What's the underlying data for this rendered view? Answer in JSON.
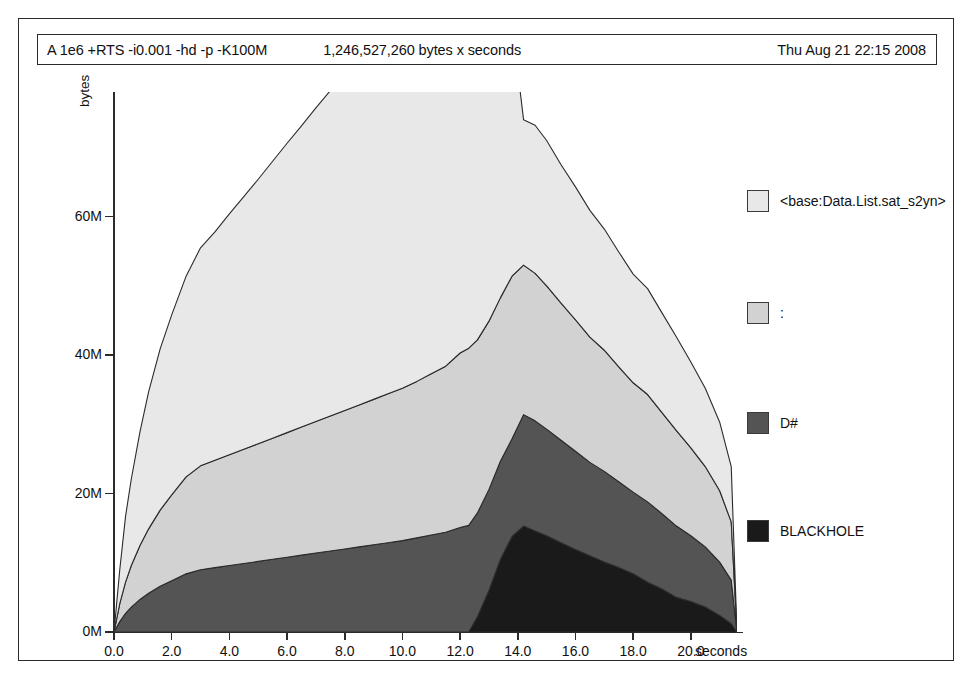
{
  "window": {
    "title_bar": {
      "command": "A 1e6 +RTS -i0.001 -hd -p -K100M",
      "total": "1,246,527,260 bytes x seconds",
      "date": "Thu Aug 21 22:15 2008"
    }
  },
  "legend": {
    "items": [
      {
        "label": "<base:Data.List.sat_s2yn>",
        "color": "#e8e8e8"
      },
      {
        "label": ":",
        "color": "#d2d2d2"
      },
      {
        "label": "D#",
        "color": "#545454"
      },
      {
        "label": "BLACKHOLE",
        "color": "#1a1a1a"
      }
    ]
  },
  "chart_data": {
    "type": "area",
    "title": "1,246,527,260 bytes x seconds",
    "xlabel": "seconds",
    "ylabel": "bytes",
    "xlim": [
      0.0,
      21.6
    ],
    "ylim": [
      0,
      78000000
    ],
    "grid": false,
    "legend_position": "right",
    "xtick_labels": [
      "0.0",
      "2.0",
      "4.0",
      "6.0",
      "8.0",
      "10.0",
      "12.0",
      "14.0",
      "16.0",
      "18.0",
      "20.0"
    ],
    "xticks": [
      0.0,
      2.0,
      4.0,
      6.0,
      8.0,
      10.0,
      12.0,
      14.0,
      16.0,
      18.0,
      20.0
    ],
    "ytick_labels": [
      "0M",
      "20M",
      "40M",
      "60M"
    ],
    "yticks": [
      0,
      20000000,
      40000000,
      60000000
    ],
    "stacked": true,
    "x": [
      0.0,
      0.2,
      0.4,
      0.6,
      0.9,
      1.2,
      1.6,
      2.0,
      2.5,
      3.0,
      3.5,
      4.0,
      4.5,
      5.0,
      5.5,
      6.0,
      6.5,
      7.0,
      7.5,
      8.0,
      8.5,
      9.0,
      9.5,
      10.0,
      10.5,
      11.0,
      11.5,
      12.0,
      12.3,
      12.6,
      13.0,
      13.4,
      13.8,
      14.2,
      14.6,
      15.0,
      15.5,
      16.0,
      16.5,
      17.0,
      17.5,
      18.0,
      18.5,
      19.0,
      19.5,
      20.0,
      20.5,
      21.0,
      21.4,
      21.6
    ],
    "series": [
      {
        "name": "BLACKHOLE",
        "values": [
          0,
          0,
          0,
          0,
          0,
          0,
          0,
          0,
          0,
          0,
          0,
          0,
          0,
          0,
          0,
          0,
          0,
          0,
          0,
          0,
          0,
          0,
          0,
          0,
          0,
          0,
          0,
          0,
          0,
          2200000,
          6000000,
          10500000,
          13800000,
          15300000,
          14600000,
          13900000,
          12900000,
          11900000,
          11000000,
          10100000,
          9300000,
          8400000,
          7200000,
          6200000,
          5000000,
          4400000,
          3600000,
          2400000,
          1200000,
          0
        ]
      },
      {
        "name": "D#",
        "values": [
          0,
          1500000,
          2700000,
          3600000,
          4700000,
          5600000,
          6600000,
          7400000,
          8400000,
          9000000,
          9300000,
          9600000,
          9900000,
          10200000,
          10500000,
          10800000,
          11100000,
          11400000,
          11700000,
          12000000,
          12300000,
          12600000,
          12900000,
          13200000,
          13600000,
          14000000,
          14400000,
          15100000,
          15400000,
          15000000,
          14600000,
          14200000,
          14100000,
          16100000,
          15900000,
          15400000,
          14800000,
          14200000,
          13500000,
          13100000,
          12400000,
          11800000,
          11600000,
          10900000,
          10300000,
          9500000,
          8700000,
          7700000,
          6300000,
          0
        ]
      },
      {
        "name": ":",
        "values": [
          0,
          2600000,
          4500000,
          6000000,
          7800000,
          9300000,
          11000000,
          12400000,
          14000000,
          15000000,
          15500000,
          16000000,
          16500000,
          17000000,
          17500000,
          18000000,
          18500000,
          19000000,
          19500000,
          20000000,
          20500000,
          21000000,
          21500000,
          22000000,
          22600000,
          23300000,
          24000000,
          25200000,
          25600000,
          25000000,
          24300000,
          23600000,
          23500000,
          21600000,
          21300000,
          20700000,
          19800000,
          19000000,
          18100000,
          17500000,
          16600000,
          15800000,
          15500000,
          14600000,
          13800000,
          12700000,
          11600000,
          10300000,
          8400000,
          0
        ]
      },
      {
        "name": "<base:Data.List.sat_s2yn>",
        "values": [
          0,
          4900000,
          9500000,
          12500000,
          16400000,
          19800000,
          23300000,
          26000000,
          29000000,
          31500000,
          33000000,
          34800000,
          36500000,
          38200000,
          40000000,
          41800000,
          43500000,
          45300000,
          47000000,
          48800000,
          50600000,
          52400000,
          54200000,
          56000000,
          58500000,
          61500000,
          64500000,
          69500000,
          72000000,
          66000000,
          57000000,
          47000000,
          36500000,
          21000000,
          21400000,
          21000000,
          20000000,
          19200000,
          18300000,
          17500000,
          16600000,
          15700000,
          15300000,
          14400000,
          13500000,
          12400000,
          11300000,
          9900000,
          8000000,
          0
        ]
      }
    ]
  }
}
